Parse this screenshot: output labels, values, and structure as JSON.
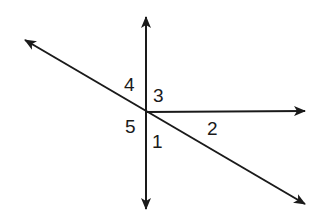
{
  "diagram": {
    "type": "intersecting lines with numbered angles",
    "intersection": {
      "x": 146,
      "y": 112
    },
    "lines": [
      {
        "name": "vertical-line",
        "from": {
          "x": 146,
          "y": 17
        },
        "to": {
          "x": 146,
          "y": 209
        },
        "arrows": "both"
      },
      {
        "name": "diagonal-line",
        "from": {
          "x": 25,
          "y": 40
        },
        "to": {
          "x": 305,
          "y": 204
        },
        "arrows": "both"
      },
      {
        "name": "horizontal-ray",
        "from": {
          "x": 146,
          "y": 112
        },
        "to": {
          "x": 305,
          "y": 111
        },
        "arrows": "end"
      }
    ],
    "labels": [
      {
        "text": "4",
        "x": 130,
        "y": 91
      },
      {
        "text": "3",
        "x": 159,
        "y": 102
      },
      {
        "text": "5",
        "x": 131,
        "y": 133
      },
      {
        "text": "1",
        "x": 158,
        "y": 148
      },
      {
        "text": "2",
        "x": 213,
        "y": 135
      }
    ],
    "stroke_color": "#1a1a1a"
  }
}
